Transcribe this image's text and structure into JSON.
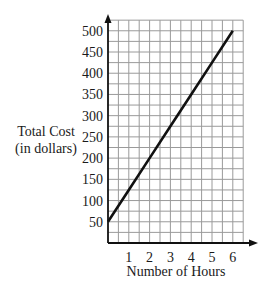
{
  "chart_data": {
    "type": "line",
    "title": "",
    "xlabel": "Number of Hours",
    "ylabel_lines": [
      "Total Cost",
      "(in dollars)"
    ],
    "ylabel": "Total Cost (in dollars)",
    "x_ticks": [
      1,
      2,
      3,
      4,
      5,
      6
    ],
    "y_ticks": [
      50,
      100,
      150,
      200,
      250,
      300,
      350,
      400,
      450,
      500
    ],
    "xlim": [
      0,
      6.5
    ],
    "ylim": [
      0,
      525
    ],
    "grid": true,
    "grid_x_step": 0.5,
    "grid_y_step": 25,
    "legend": null,
    "series": [
      {
        "name": "Total Cost",
        "x": [
          0,
          1,
          2,
          3,
          4,
          5,
          6
        ],
        "y": [
          50,
          125,
          200,
          275,
          350,
          425,
          500
        ],
        "color": "#111111"
      }
    ]
  },
  "colors": {
    "axis": "#111111",
    "grid": "#9a9a9a",
    "line": "#111111"
  }
}
